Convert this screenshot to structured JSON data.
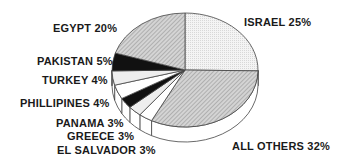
{
  "chart_data": {
    "type": "pie",
    "style": "3d-exploded-oblique",
    "title": "",
    "categories": [
      "ISRAEL",
      "ALL OTHERS",
      "EL SALVADOR",
      "GREECE",
      "PANAMA",
      "PHILLIPINES",
      "TURKEY",
      "PAKISTAN",
      "EGYPT"
    ],
    "values": [
      25,
      32,
      3,
      3,
      3,
      4,
      4,
      5,
      20
    ],
    "unit": "%",
    "labels": {
      "israel": "ISRAEL 25%",
      "all_others": "ALL OTHERS 32%",
      "el_salvador": "EL SALVADOR 3%",
      "greece": "GREECE 3%",
      "panama": "PANAMA 3%",
      "phillipines": "PHILLIPINES 4%",
      "turkey": "TURKEY 4%",
      "pakistan": "PAKISTAN 5%",
      "egypt": "EGYPT 20%"
    },
    "fills": {
      "israel": "#efefef",
      "all_others": "#b8b8b8",
      "el_salvador": "#ffffff",
      "greece": "#e6e6e6",
      "panama": "#111111",
      "phillipines": "#ffffff",
      "turkey": "#f0f0f0",
      "pakistan": "#111111",
      "egypt_extra": "#ffffff",
      "egypt": "#bdbdbd"
    },
    "legend": "none (direct labels)"
  }
}
